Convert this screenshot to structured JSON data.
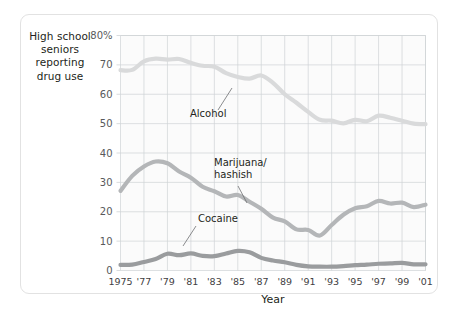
{
  "figure": {
    "y_axis_caption_lines": [
      "High school",
      "seniors",
      "reporting",
      "drug use"
    ],
    "x_axis_title": "Year"
  },
  "colors": {
    "alcohol": "#d9dadb",
    "marijuana": "#b4b6b8",
    "cocaine": "#9a9c9e",
    "grid": "#cfd3d6",
    "plot_background": "#fbfbfb",
    "card_border": "#e2e2e2",
    "text": "#231f20",
    "tick_text": "#58595b"
  },
  "chart_data": {
    "type": "line",
    "title": "",
    "xlabel": "Year",
    "ylabel": "High school seniors reporting drug use",
    "xlim": [
      1975,
      2001
    ],
    "ylim": [
      0,
      80
    ],
    "grid": true,
    "legend_position": "inline-annotations",
    "y_ticks": [
      0,
      10,
      20,
      30,
      40,
      50,
      60,
      70,
      80
    ],
    "y_tick_labels": [
      "0",
      "10",
      "20",
      "30",
      "40",
      "50",
      "60",
      "70",
      "80%"
    ],
    "x_ticks": [
      1975,
      1977,
      1979,
      1981,
      1983,
      1985,
      1987,
      1989,
      1991,
      1993,
      1995,
      1997,
      1999,
      2001
    ],
    "x_tick_labels": [
      "1975",
      "'77",
      "'79",
      "'81",
      "'83",
      "'85",
      "'87",
      "'89",
      "'91",
      "'93",
      "'95",
      "'97",
      "'99",
      "'01"
    ],
    "x": [
      1975,
      1976,
      1977,
      1978,
      1979,
      1980,
      1981,
      1982,
      1983,
      1984,
      1985,
      1986,
      1987,
      1988,
      1989,
      1990,
      1991,
      1992,
      1993,
      1994,
      1995,
      1996,
      1997,
      1998,
      1999,
      2000,
      2001
    ],
    "series": [
      {
        "name": "Alcohol",
        "color": "#d9dadb",
        "values": [
          68.2,
          68.3,
          71.2,
          72.1,
          71.8,
          72.0,
          70.7,
          69.7,
          69.4,
          67.2,
          65.9,
          65.3,
          66.4,
          63.9,
          60.0,
          57.1,
          54.0,
          51.3,
          51.0,
          50.1,
          51.3,
          50.8,
          52.7,
          52.0,
          51.0,
          50.0,
          49.8
        ]
      },
      {
        "name": "Marijuana/hashish",
        "color": "#b4b6b8",
        "values": [
          27.1,
          32.2,
          35.4,
          37.1,
          36.5,
          33.7,
          31.6,
          28.5,
          27.0,
          25.2,
          25.7,
          23.4,
          21.0,
          18.0,
          16.7,
          14.0,
          13.8,
          11.9,
          15.5,
          19.0,
          21.2,
          21.9,
          23.7,
          22.8,
          23.1,
          21.6,
          22.4
        ]
      },
      {
        "name": "Cocaine",
        "color": "#9a9c9e",
        "values": [
          1.9,
          2.0,
          2.9,
          3.9,
          5.7,
          5.2,
          5.8,
          5.0,
          4.9,
          5.8,
          6.7,
          6.2,
          4.3,
          3.4,
          2.8,
          1.9,
          1.4,
          1.3,
          1.3,
          1.5,
          1.8,
          2.0,
          2.3,
          2.4,
          2.6,
          2.1,
          2.1
        ]
      }
    ],
    "annotations": [
      {
        "label": "Alcohol",
        "at_x": 1985,
        "at_y": 66.0
      },
      {
        "label": "Marijuana/hashish",
        "at_x": 1991,
        "at_y": 14.0
      },
      {
        "label": "Cocaine",
        "at_x": 1980,
        "at_y": 5.2
      }
    ]
  }
}
